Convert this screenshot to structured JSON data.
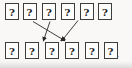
{
  "diagram": {
    "top_row": {
      "cells": [
        "?",
        "?",
        "?",
        "?",
        "?",
        "?"
      ]
    },
    "bottom_row": {
      "cells": [
        "?",
        "?",
        "?",
        "?",
        "?",
        "?"
      ]
    },
    "arrows": [
      {
        "name": "arrow-top-box2-to-bottom-box4",
        "from": "top-box-2",
        "to": "bottom-box-4",
        "x1": 33,
        "y1": 21.5,
        "x2": 64.5,
        "y2": 40.5
      },
      {
        "name": "arrow-top-box3-to-bottom-box3",
        "from": "top-box-3",
        "to": "bottom-box-3",
        "x1": 50,
        "y1": 21.5,
        "x2": 43.5,
        "y2": 40.5
      },
      {
        "name": "arrow-top-box5-to-bottom-box4",
        "from": "top-box-5",
        "to": "bottom-box-4",
        "x1": 78,
        "y1": 20.5,
        "x2": 62,
        "y2": 40.5
      }
    ],
    "trailing_punctuation": ","
  },
  "colors": {
    "background": "#f9f8f6",
    "box_border": "#3d3d3d",
    "box_fill": "#fdfdfc",
    "glyph": "#1b1b1b",
    "arrow": "#282828"
  }
}
